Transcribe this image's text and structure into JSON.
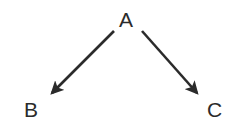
{
  "diagram": {
    "type": "directed-graph",
    "title": "",
    "background_color": "#ffffff",
    "stroke_color": "#2b2b2b",
    "text_color": "#2b2b2b",
    "nodes": [
      {
        "id": "A",
        "label": "A",
        "x": 128,
        "y": 19
      },
      {
        "id": "B",
        "label": "B",
        "x": 32,
        "y": 110
      },
      {
        "id": "C",
        "label": "C",
        "x": 215,
        "y": 110
      }
    ],
    "edges": [
      {
        "id": "edge-a-b",
        "from": "A",
        "to": "B",
        "label": "",
        "arrowhead": "filled-triangle",
        "x1": 114,
        "y1": 31,
        "x2": 48,
        "y2": 97
      },
      {
        "id": "edge-a-c",
        "from": "A",
        "to": "C",
        "label": "",
        "arrowhead": "filled-triangle",
        "x1": 142,
        "y1": 31,
        "x2": 201,
        "y2": 97
      }
    ]
  }
}
